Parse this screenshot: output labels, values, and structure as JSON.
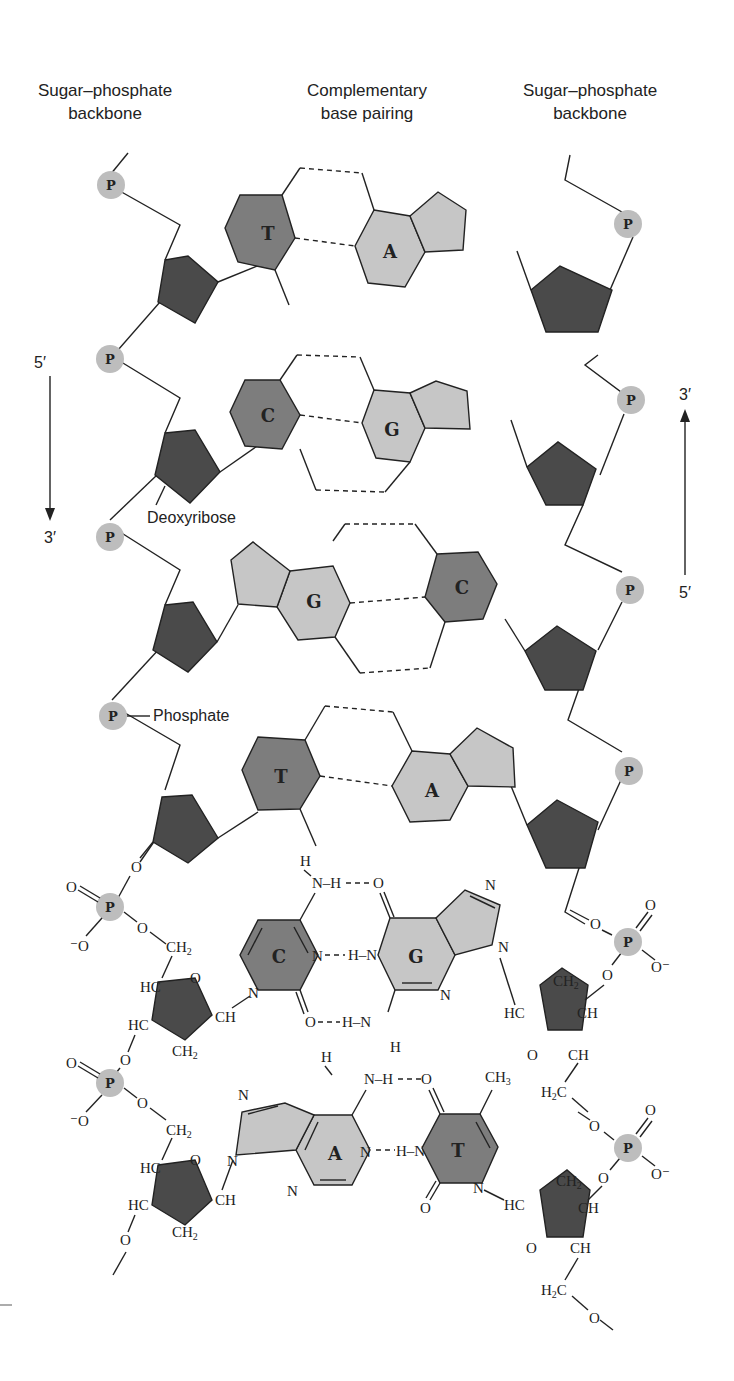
{
  "headers": {
    "left_backbone": [
      "Sugar–phosphate",
      "backbone"
    ],
    "center": [
      "Complementary",
      "base pairing"
    ],
    "right_backbone": [
      "Sugar–phosphate",
      "backbone"
    ]
  },
  "strand_direction": {
    "left": {
      "top": "5′",
      "bottom": "3′",
      "arrow": "down"
    },
    "right": {
      "top": "3′",
      "bottom": "5′",
      "arrow": "up"
    }
  },
  "annotations": {
    "deoxyribose": "Deoxyribose",
    "phosphate": "Phosphate"
  },
  "phosphate_symbol": "P",
  "schematic_pairs": [
    {
      "left": "T",
      "right": "A",
      "hbonds": 2
    },
    {
      "left": "C",
      "right": "G",
      "hbonds": 3
    },
    {
      "left": "G",
      "right": "C",
      "hbonds": 3
    },
    {
      "left": "T",
      "right": "A",
      "hbonds": 2
    }
  ],
  "chemical_pairs": [
    {
      "left": "C",
      "right": "G",
      "hbonds": 3
    },
    {
      "left": "A",
      "right": "T",
      "hbonds": 2
    }
  ],
  "chem_labels": {
    "O": "O",
    "Ominus": "⁻O",
    "Ominus_r": "O⁻",
    "N": "N",
    "H": "H",
    "NH": "N–H",
    "HN": "H–N",
    "CH": "CH",
    "HC": "HC",
    "CH2": "CH",
    "H2C": "H",
    "CH3": "CH",
    "sub2": "2",
    "sub3": "3"
  },
  "colors": {
    "sugar": "#4a4a4a",
    "pyrimidine": "#7d7d7d",
    "purine": "#c6c6c6",
    "phosphate": "#bdbdbd"
  }
}
